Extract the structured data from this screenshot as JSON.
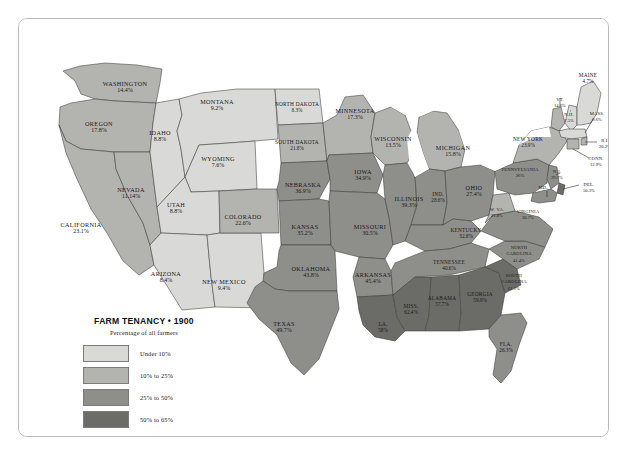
{
  "legend": {
    "title": "FARM TENANCY • 1900",
    "subtitle": "Percentage of all farmers",
    "bins": [
      {
        "label": "Under 10%",
        "color": "#d9d9d7"
      },
      {
        "label": "10% to 25%",
        "color": "#b3b3b0"
      },
      {
        "label": "25% to 50%",
        "color": "#8e8e8b"
      },
      {
        "label": "50% to 65%",
        "color": "#6b6b68"
      }
    ]
  },
  "colors": {
    "water": "#ffffff",
    "page_background": "#ffffff",
    "frame_background": "#fdfdfd",
    "frame_border": "#b9b9b9",
    "state_border": "#3c3c3c"
  },
  "chart_data": {
    "type": "map",
    "title": "FARM TENANCY • 1900",
    "subtitle": "Percentage of all farmers",
    "unit": "percent",
    "legend_position": "bottom-left",
    "bins": [
      {
        "label": "Under 10%",
        "min": 0,
        "max": 10,
        "color": "#d9d9d7"
      },
      {
        "label": "10% to 25%",
        "min": 10,
        "max": 25,
        "color": "#b3b3b0"
      },
      {
        "label": "25% to 50%",
        "min": 25,
        "max": 50,
        "color": "#8e8e8b"
      },
      {
        "label": "50% to 65%",
        "min": 50,
        "max": 65,
        "color": "#6b6b68"
      }
    ],
    "values": {
      "WA": 14.4,
      "OR": 17.8,
      "CA": 23.1,
      "NV": 11.14,
      "ID": 8.8,
      "MT": 9.2,
      "WY": 7.6,
      "UT": 8.8,
      "AZ": 8.4,
      "NM": 9.4,
      "CO": 22.6,
      "ND": 8.3,
      "SD": 21.8,
      "NE": 36.9,
      "KS": 35.2,
      "OK": 43.8,
      "TX": 49.7,
      "MN": 17.3,
      "IA": 34.9,
      "MO": 30.5,
      "AR": 45.4,
      "LA": 58.0,
      "WI": 13.5,
      "IL": 39.3,
      "MI": 15.8,
      "IN": 28.6,
      "OH": 27.4,
      "KY": 32.8,
      "TN": 40.6,
      "MS": 62.4,
      "AL": 57.7,
      "GA": 59.9,
      "FL": 26.3,
      "SC": 61.1,
      "NC": 41.4,
      "VA": 30.7,
      "WV": 21.8,
      "PA": 26.0,
      "NY": 23.9,
      "VT": 14.6,
      "NH": 7.5,
      "ME": 4.7,
      "MA": 9.6,
      "RI": 20.2,
      "CT": 12.9,
      "NJ": 29.7,
      "DE": 50.3,
      "MD": 29.7
    }
  },
  "states": [
    {
      "id": "WA",
      "name": "WASHINGTON",
      "value": "14.4%",
      "fill": "#b3b3b0",
      "lx": 106,
      "ly": 67,
      "size": ""
    },
    {
      "id": "OR",
      "name": "OREGON",
      "value": "17.8%",
      "fill": "#b3b3b0",
      "lx": 80,
      "ly": 107,
      "size": ""
    },
    {
      "id": "CA",
      "name": "CALIFORNIA",
      "value": "23.1%",
      "fill": "#b3b3b0",
      "lx": 62,
      "ly": 208,
      "size": ""
    },
    {
      "id": "NV",
      "name": "NEVADA",
      "value": "11.14%",
      "fill": "#b3b3b0",
      "lx": 112,
      "ly": 173,
      "size": ""
    },
    {
      "id": "ID",
      "name": "IDAHO",
      "value": "8.8%",
      "fill": "#d9d9d7",
      "lx": 141,
      "ly": 116,
      "size": ""
    },
    {
      "id": "MT",
      "name": "MONTANA",
      "value": "9.2%",
      "fill": "#d9d9d7",
      "lx": 198,
      "ly": 85,
      "size": ""
    },
    {
      "id": "WY",
      "name": "WYOMING",
      "value": "7.6%",
      "fill": "#d9d9d7",
      "lx": 199,
      "ly": 142,
      "size": ""
    },
    {
      "id": "UT",
      "name": "UTAH",
      "value": "8.8%",
      "fill": "#d9d9d7",
      "lx": 157,
      "ly": 188,
      "size": ""
    },
    {
      "id": "AZ",
      "name": "ARIZONA",
      "value": "8.4%",
      "fill": "#d9d9d7",
      "lx": 147,
      "ly": 257,
      "size": ""
    },
    {
      "id": "NM",
      "name": "NEW MEXICO",
      "value": "9.4%",
      "fill": "#d9d9d7",
      "lx": 205,
      "ly": 265,
      "size": ""
    },
    {
      "id": "CO",
      "name": "COLORADO",
      "value": "22.6%",
      "fill": "#b3b3b0",
      "lx": 224,
      "ly": 200,
      "size": ""
    },
    {
      "id": "ND",
      "name": "NORTH DAKOTA",
      "value": "8.3%",
      "fill": "#d9d9d7",
      "lx": 278,
      "ly": 87,
      "size": "sm"
    },
    {
      "id": "SD",
      "name": "SOUTH DAKOTA",
      "value": "21.8%",
      "fill": "#b3b3b0",
      "lx": 278,
      "ly": 125,
      "size": "sm"
    },
    {
      "id": "NE",
      "name": "NEBRASKA",
      "value": "36.9%",
      "fill": "#8e8e8b",
      "lx": 284,
      "ly": 168,
      "size": ""
    },
    {
      "id": "KS",
      "name": "KANSAS",
      "value": "35.2%",
      "fill": "#8e8e8b",
      "lx": 286,
      "ly": 210,
      "size": ""
    },
    {
      "id": "OK",
      "name": "OKLAHOMA",
      "value": "43.8%",
      "fill": "#8e8e8b",
      "lx": 292,
      "ly": 252,
      "size": ""
    },
    {
      "id": "TX",
      "name": "TEXAS",
      "value": "49.7%",
      "fill": "#8e8e8b",
      "lx": 265,
      "ly": 307,
      "size": ""
    },
    {
      "id": "MN",
      "name": "MINNESOTA",
      "value": "17.3%",
      "fill": "#b3b3b0",
      "lx": 336,
      "ly": 94,
      "size": ""
    },
    {
      "id": "IA",
      "name": "IOWA",
      "value": "34.9%",
      "fill": "#8e8e8b",
      "lx": 344,
      "ly": 155,
      "size": ""
    },
    {
      "id": "MO",
      "name": "MISSOURI",
      "value": "30.5%",
      "fill": "#8e8e8b",
      "lx": 351,
      "ly": 210,
      "size": ""
    },
    {
      "id": "AR",
      "name": "ARKANSAS",
      "value": "45.4%",
      "fill": "#8e8e8b",
      "lx": 354,
      "ly": 258,
      "size": ""
    },
    {
      "id": "LA",
      "name": "LA.",
      "value": "58%",
      "fill": "#6b6b68",
      "lx": 364,
      "ly": 307,
      "size": "sm"
    },
    {
      "id": "WI",
      "name": "WISCONSIN",
      "value": "13.5%",
      "fill": "#b3b3b0",
      "lx": 374,
      "ly": 122,
      "size": ""
    },
    {
      "id": "IL",
      "name": "ILLINOIS",
      "value": "39.3%",
      "fill": "#8e8e8b",
      "lx": 390,
      "ly": 182,
      "size": ""
    },
    {
      "id": "MI",
      "name": "MICHIGAN",
      "value": "15.8%",
      "fill": "#b3b3b0",
      "lx": 434,
      "ly": 131,
      "size": ""
    },
    {
      "id": "IN",
      "name": "IND.",
      "value": "28.6%",
      "fill": "#8e8e8b",
      "lx": 419,
      "ly": 177,
      "size": "sm"
    },
    {
      "id": "OH",
      "name": "OHIO",
      "value": "27.4%",
      "fill": "#8e8e8b",
      "lx": 455,
      "ly": 171,
      "size": ""
    },
    {
      "id": "KY",
      "name": "KENTUCKY",
      "value": "32.8%",
      "fill": "#8e8e8b",
      "lx": 447,
      "ly": 213,
      "size": "sm"
    },
    {
      "id": "TN",
      "name": "TENNESSEE",
      "value": "40.6%",
      "fill": "#8e8e8b",
      "lx": 430,
      "ly": 245,
      "size": "sm"
    },
    {
      "id": "MS",
      "name": "MISS.",
      "value": "62.4%",
      "fill": "#6b6b68",
      "lx": 392,
      "ly": 289,
      "size": "sm"
    },
    {
      "id": "AL",
      "name": "ALABAMA",
      "value": "57.7%",
      "fill": "#6b6b68",
      "lx": 423,
      "ly": 281,
      "size": "sm"
    },
    {
      "id": "GA",
      "name": "GEORGIA",
      "value": "59.9%",
      "fill": "#6b6b68",
      "lx": 461,
      "ly": 277,
      "size": "sm"
    },
    {
      "id": "FL",
      "name": "FLA.",
      "value": "26.3%",
      "fill": "#8e8e8b",
      "lx": 487,
      "ly": 327,
      "size": "sm"
    },
    {
      "id": "SC",
      "name": "SOUTH CAROLINA",
      "value": "61.1%",
      "fill": "#6b6b68",
      "lx": 495,
      "ly": 258,
      "size": "xs"
    },
    {
      "id": "NC",
      "name": "NORTH CAROLINA",
      "value": "41.4%",
      "fill": "#8e8e8b",
      "lx": 500,
      "ly": 230,
      "size": "xs"
    },
    {
      "id": "VA",
      "name": "VIRGINIA",
      "value": "30.7%",
      "fill": "#8e8e8b",
      "lx": 509,
      "ly": 194,
      "size": "xs"
    },
    {
      "id": "WV",
      "name": "W. VA.",
      "value": "21.8%",
      "fill": "#b3b3b0",
      "lx": 478,
      "ly": 192,
      "size": "xs"
    },
    {
      "id": "PA",
      "name": "PENNSYLVANIA",
      "value": "26%",
      "fill": "#8e8e8b",
      "lx": 501,
      "ly": 152,
      "size": "xs"
    },
    {
      "id": "NY",
      "name": "NEW YORK",
      "value": "23.9%",
      "fill": "#b3b3b0",
      "lx": 509,
      "ly": 122,
      "size": "sm"
    },
    {
      "id": "VT",
      "name": "VT.",
      "value": "14.6%",
      "fill": "#b3b3b0",
      "lx": 541,
      "ly": 82,
      "size": "xs"
    },
    {
      "id": "NH",
      "name": "N.H.",
      "value": "7.5%",
      "fill": "#d9d9d7",
      "lx": 550,
      "ly": 97,
      "size": "xs"
    },
    {
      "id": "ME",
      "name": "MAINE",
      "value": "4.7%",
      "fill": "#d9d9d7",
      "lx": 569,
      "ly": 58,
      "size": "sm"
    },
    {
      "id": "MA",
      "name": "MASS.",
      "value": "9.6%",
      "fill": "#d9d9d7",
      "lx": 578,
      "ly": 96,
      "size": "xs"
    },
    {
      "id": "RI",
      "name": "R.I.",
      "value": "20.2%",
      "fill": "#b3b3b0",
      "lx": 586,
      "ly": 123,
      "size": "xs"
    },
    {
      "id": "CT",
      "name": "CONN.",
      "value": "12.9%",
      "fill": "#b3b3b0",
      "lx": 577,
      "ly": 141,
      "size": "xs"
    },
    {
      "id": "NJ",
      "name": "N.J.",
      "value": "29.7%",
      "fill": "#8e8e8b",
      "lx": 538,
      "ly": 154,
      "size": "xs"
    },
    {
      "id": "DE",
      "name": "DEL.",
      "value": "50.3%",
      "fill": "#6b6b68",
      "lx": 570,
      "ly": 167,
      "size": "xs"
    },
    {
      "id": "MD",
      "name": "MD.",
      "value": "",
      "fill": "#8e8e8b",
      "lx": 524,
      "ly": 170,
      "size": "xs"
    }
  ]
}
